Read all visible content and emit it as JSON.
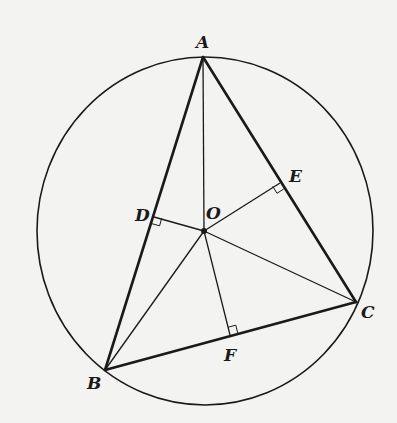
{
  "diagram": {
    "type": "geometry",
    "colors": {
      "background": "#f3f3f1",
      "ink": "#1a1a1a"
    },
    "circle": {
      "cx": 205,
      "cy": 231,
      "rx": 168,
      "ry": 174
    },
    "points": {
      "A": {
        "x": 203,
        "y": 57,
        "label": "A"
      },
      "B": {
        "x": 105,
        "y": 370,
        "label": "B"
      },
      "C": {
        "x": 356,
        "y": 302,
        "label": "C"
      },
      "O": {
        "x": 204,
        "y": 231,
        "label": "O"
      },
      "D": {
        "x": 154,
        "y": 217,
        "label": "D"
      },
      "E": {
        "x": 280,
        "y": 183,
        "label": "E"
      },
      "F": {
        "x": 230,
        "y": 335,
        "label": "F"
      }
    },
    "labels": {
      "A": "A",
      "B": "B",
      "C": "C",
      "D": "D",
      "E": "E",
      "F": "F",
      "O": "O"
    },
    "triangle_sides": [
      "AB",
      "BC",
      "CA"
    ],
    "radii": [
      "OA",
      "OB",
      "OC"
    ],
    "perpendiculars": [
      "OD",
      "OE",
      "OF"
    ],
    "right_angle_marks": [
      "D",
      "E",
      "F"
    ]
  }
}
